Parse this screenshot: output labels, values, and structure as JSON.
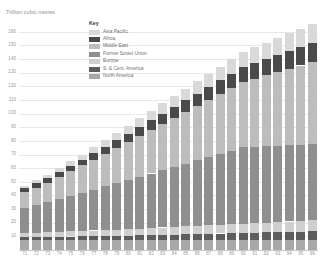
{
  "axis_title": "Trillion cubic metres",
  "legend": {
    "title": "Key",
    "items": [
      {
        "label": "Asia Pacific",
        "color": "#d9d9d9"
      },
      {
        "label": "Africa",
        "color": "#4a4a4a"
      },
      {
        "label": "Middle East",
        "color": "#bdbdbd"
      },
      {
        "label": "Former Soviet Union",
        "color": "#8f8f8f"
      },
      {
        "label": "Europe",
        "color": "#cfcfcf"
      },
      {
        "label": "S. & Cent. America",
        "color": "#5d5d5d"
      },
      {
        "label": "North America",
        "color": "#a8a8a8"
      }
    ]
  },
  "chart_data": {
    "type": "bar",
    "title": "Trillion cubic metres",
    "xlabel": "",
    "ylabel": "Trillion cubic metres",
    "ylim": [
      0,
      165
    ],
    "yticks": [
      10,
      20,
      30,
      40,
      50,
      60,
      70,
      80,
      90,
      100,
      110,
      120,
      130,
      140,
      150,
      160
    ],
    "grid": true,
    "stacked": true,
    "legend_position": "inside-top-left",
    "categories": [
      "71",
      "72",
      "73",
      "74",
      "75",
      "76",
      "77",
      "78",
      "79",
      "80",
      "81",
      "82",
      "83",
      "84",
      "85",
      "86",
      "87",
      "88",
      "89",
      "90",
      "91",
      "92",
      "93",
      "94",
      "95",
      "96"
    ],
    "series": [
      {
        "name": "North America",
        "color": "#a8a8a8",
        "values": [
          7.5,
          7.5,
          7.5,
          7.5,
          7.5,
          7.5,
          7.5,
          7.5,
          7.5,
          7.5,
          7.5,
          7.5,
          7.5,
          7.5,
          7.5,
          7.5,
          7.5,
          7.5,
          7.5,
          7.5,
          7.5,
          7.5,
          7.5,
          7.5,
          7.5,
          7.5
        ]
      },
      {
        "name": "S. & Cent. America",
        "color": "#5d5d5d",
        "values": [
          2.0,
          2.1,
          2.2,
          2.3,
          2.4,
          2.5,
          2.6,
          2.7,
          2.8,
          3.0,
          3.2,
          3.4,
          3.6,
          3.8,
          4.0,
          4.2,
          4.4,
          4.6,
          4.8,
          5.0,
          5.2,
          5.4,
          5.6,
          5.8,
          6.0,
          6.2
        ]
      },
      {
        "name": "Europe",
        "color": "#cfcfcf",
        "values": [
          3.0,
          3.2,
          3.4,
          3.6,
          3.8,
          4.0,
          4.2,
          4.4,
          4.6,
          4.8,
          5.0,
          5.2,
          5.4,
          5.6,
          5.8,
          6.0,
          6.2,
          6.4,
          6.6,
          6.8,
          7.0,
          7.2,
          7.4,
          7.6,
          7.8,
          8.0
        ]
      },
      {
        "name": "Former Soviet Union",
        "color": "#8f8f8f",
        "values": [
          18,
          20,
          22,
          24,
          26,
          28,
          30,
          32,
          34,
          36,
          38,
          40,
          42,
          44,
          46,
          48,
          50,
          52,
          54,
          56,
          56,
          56,
          56,
          56,
          56,
          56
        ]
      },
      {
        "name": "Middle East",
        "color": "#bdbdbd",
        "values": [
          12,
          13,
          14,
          16,
          18,
          20,
          22,
          24,
          26,
          28,
          30,
          32,
          34,
          36,
          38,
          40,
          42,
          44,
          46,
          48,
          50,
          52,
          54,
          56,
          58,
          60
        ]
      },
      {
        "name": "Africa",
        "color": "#4a4a4a",
        "values": [
          3.0,
          3.2,
          3.4,
          3.6,
          3.8,
          4.0,
          4.5,
          5.0,
          5.5,
          6.0,
          6.5,
          7.0,
          7.5,
          8.0,
          8.5,
          9.0,
          9.5,
          10.0,
          10.5,
          11.0,
          11.5,
          12.0,
          12.5,
          13.0,
          13.5,
          14.0
        ]
      },
      {
        "name": "Asia Pacific",
        "color": "#d9d9d9",
        "values": [
          1.5,
          2.0,
          2.5,
          3.0,
          3.5,
          4.0,
          4.5,
          5.0,
          5.5,
          6.0,
          6.5,
          7.0,
          7.5,
          8.0,
          8.5,
          9.0,
          9.5,
          10.0,
          10.5,
          11.0,
          11.5,
          12.0,
          12.5,
          13.0,
          13.5,
          14.0
        ]
      }
    ],
    "totals": [
      47,
      51,
      55,
      60,
      65,
      70,
      76,
      81,
      86,
      91,
      97,
      102,
      108,
      113,
      118,
      124,
      129,
      135,
      140,
      145,
      149,
      152,
      155,
      159,
      162,
      166
    ]
  }
}
